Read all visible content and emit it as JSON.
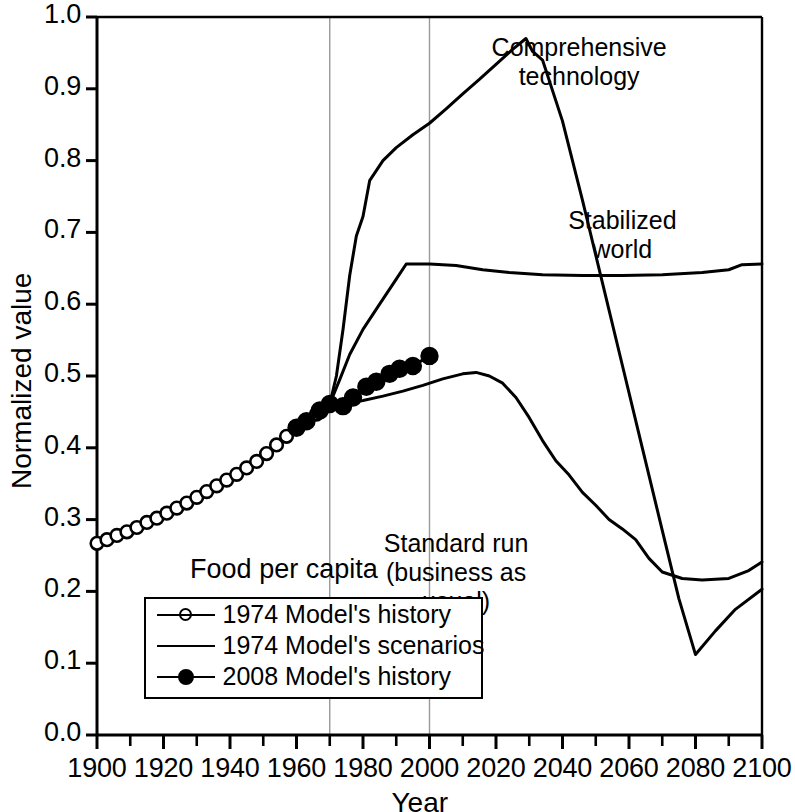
{
  "chart_data": {
    "type": "line",
    "title": "",
    "xlabel": "Year",
    "ylabel": "Normalized value",
    "xlim": [
      1900,
      2100
    ],
    "ylim": [
      0.0,
      1.0
    ],
    "xticks": [
      1900,
      1920,
      1940,
      1960,
      1980,
      2000,
      2020,
      2040,
      2060,
      2080,
      2100
    ],
    "xtick_labels": [
      "1900",
      "1920",
      "1940",
      "1960",
      "1980",
      "2000",
      "2020",
      "2040",
      "2060",
      "2080",
      "2100"
    ],
    "x_minor_tick_interval": 10,
    "yticks": [
      0.0,
      0.1,
      0.2,
      0.3,
      0.4,
      0.5,
      0.6,
      0.7,
      0.8,
      0.9,
      1.0
    ],
    "ytick_labels": [
      "0.0",
      "0.1",
      "0.2",
      "0.3",
      "0.4",
      "0.5",
      "0.6",
      "0.7",
      "0.8",
      "0.9",
      "1.0"
    ],
    "grid": "vertical gridlines at 1970 and 2000 only",
    "gridlines_x": [
      1970,
      2000
    ],
    "grid_color": "#999999",
    "line_color": "#000000",
    "legend_position": "lower-left inside axes",
    "legend_title": "Food per capita",
    "legend_entries": [
      {
        "label": "1974 Model's history",
        "marker": "open-circle",
        "line": "solid"
      },
      {
        "label": "1974 Model's scenarios",
        "marker": "none",
        "line": "solid"
      },
      {
        "label": "2008 Model's history",
        "marker": "filled-circle",
        "line": "solid"
      }
    ],
    "annotations": [
      {
        "text": "Comprehensive\ntechnology",
        "x": 2045,
        "y": 0.955
      },
      {
        "text": "Stabilized\nworld",
        "x": 2058,
        "y": 0.715
      },
      {
        "text": "Standard run\n(business as\nusual)",
        "x": 2008,
        "y": 0.265
      }
    ],
    "series": [
      {
        "name": "1974 Model's history",
        "marker": "open-circle",
        "x": [
          1900,
          1903,
          1906,
          1909,
          1912,
          1915,
          1918,
          1921,
          1924,
          1927,
          1930,
          1933,
          1936,
          1939,
          1942,
          1945,
          1948,
          1951,
          1954,
          1957,
          1960,
          1963,
          1966,
          1970
        ],
        "y": [
          0.267,
          0.272,
          0.278,
          0.283,
          0.289,
          0.296,
          0.302,
          0.309,
          0.316,
          0.323,
          0.331,
          0.339,
          0.347,
          0.355,
          0.363,
          0.372,
          0.381,
          0.392,
          0.404,
          0.416,
          0.429,
          0.437,
          0.447,
          0.461
        ]
      },
      {
        "name": "2008 Model's history",
        "marker": "filled-circle",
        "x": [
          1960,
          1963,
          1967,
          1970,
          1974,
          1977,
          1981,
          1984,
          1988,
          1991,
          1995,
          2000
        ],
        "y": [
          0.428,
          0.437,
          0.452,
          0.461,
          0.458,
          0.47,
          0.485,
          0.492,
          0.503,
          0.51,
          0.514,
          0.528
        ]
      },
      {
        "name": "Comprehensive technology",
        "marker": "none",
        "x": [
          1970,
          1972,
          1974,
          1976,
          1978,
          1980,
          1982,
          1986,
          1990,
          1995,
          2000,
          2005,
          2010,
          2015,
          2020,
          2025,
          2029,
          2031,
          2034,
          2040,
          2046,
          2052,
          2058,
          2064,
          2070,
          2075,
          2080,
          2086,
          2092,
          2100
        ],
        "y": [
          0.461,
          0.5,
          0.565,
          0.64,
          0.695,
          0.722,
          0.772,
          0.8,
          0.818,
          0.836,
          0.852,
          0.872,
          0.893,
          0.913,
          0.934,
          0.955,
          0.97,
          0.952,
          0.94,
          0.855,
          0.745,
          0.63,
          0.515,
          0.4,
          0.285,
          0.19,
          0.112,
          0.145,
          0.175,
          0.203
        ]
      },
      {
        "name": "Stabilized world",
        "marker": "none",
        "x": [
          1970,
          1973,
          1976,
          1980,
          1985,
          1990,
          1993,
          2000,
          2008,
          2016,
          2024,
          2034,
          2046,
          2058,
          2070,
          2082,
          2090,
          2094,
          2100
        ],
        "y": [
          0.461,
          0.495,
          0.53,
          0.565,
          0.6,
          0.635,
          0.656,
          0.656,
          0.654,
          0.648,
          0.644,
          0.641,
          0.64,
          0.64,
          0.641,
          0.644,
          0.648,
          0.655,
          0.656
        ]
      },
      {
        "name": "Standard run (business as usual)",
        "marker": "none",
        "x": [
          1970,
          1975,
          1980,
          1986,
          1992,
          1998,
          2004,
          2010,
          2014,
          2018,
          2022,
          2026,
          2030,
          2034,
          2038,
          2042,
          2046,
          2050,
          2054,
          2058,
          2062,
          2066,
          2070,
          2076,
          2082,
          2090,
          2096,
          2100
        ],
        "y": [
          0.461,
          0.462,
          0.466,
          0.472,
          0.479,
          0.487,
          0.496,
          0.503,
          0.505,
          0.5,
          0.49,
          0.47,
          0.442,
          0.41,
          0.382,
          0.362,
          0.338,
          0.32,
          0.3,
          0.287,
          0.272,
          0.246,
          0.227,
          0.218,
          0.216,
          0.218,
          0.229,
          0.241
        ]
      }
    ]
  },
  "axes": {
    "x_title": "Year",
    "y_title": "Normalized value"
  },
  "legend": {
    "title": "Food per capita",
    "rows": [
      "1974 Model's history",
      "1974 Model's scenarios",
      "2008 Model's history"
    ]
  },
  "annotations": {
    "comprehensive_technology": "Comprehensive\ntechnology",
    "stabilized_world": "Stabilized\nworld",
    "standard_run": "Standard run\n(business as\nusual)"
  }
}
